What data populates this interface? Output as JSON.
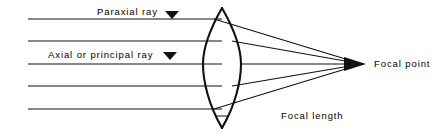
{
  "diagram": {
    "stroke_color": "#111111",
    "background_color": "#ffffff",
    "labels": {
      "paraxial_ray": "Paraxial ray",
      "axial_ray": "Axial or principal ray",
      "focal_point": "Focal point",
      "focal_length": "Focal length"
    },
    "markers": {
      "paraxial_pointer": "triangle-down-marker",
      "axial_pointer": "triangle-down-marker",
      "focal_point_arrow": "arrowhead-right"
    },
    "lens": {
      "shape": "biconvex",
      "center_x": 222,
      "top_y": 8,
      "bottom_y": 128,
      "left_edge_x": 203,
      "right_edge_x": 241
    },
    "focal_point": {
      "x": 362,
      "y": 64
    },
    "incoming_rays": [
      {
        "name": "ray-1",
        "y": 19,
        "x_start": 28,
        "x_end": 222
      },
      {
        "name": "ray-2",
        "y": 41,
        "x_start": 28,
        "x_end": 222
      },
      {
        "name": "ray-3-axial",
        "y": 64,
        "x_start": 28,
        "x_end": 222
      },
      {
        "name": "ray-4",
        "y": 86,
        "x_start": 28,
        "x_end": 222
      },
      {
        "name": "ray-5",
        "y": 109,
        "x_start": 28,
        "x_end": 222
      }
    ],
    "refracted_rays": [
      {
        "name": "refracted-1",
        "from_y": 19,
        "exit_x": 230,
        "exit_y": 22
      },
      {
        "name": "refracted-2",
        "from_y": 41,
        "exit_x": 239,
        "exit_y": 42
      },
      {
        "name": "refracted-3-axial",
        "from_y": 64,
        "exit_x": 241,
        "exit_y": 64
      },
      {
        "name": "refracted-4",
        "from_y": 86,
        "exit_x": 239,
        "exit_y": 86
      },
      {
        "name": "refracted-5",
        "from_y": 109,
        "exit_x": 231,
        "exit_y": 107
      }
    ]
  }
}
